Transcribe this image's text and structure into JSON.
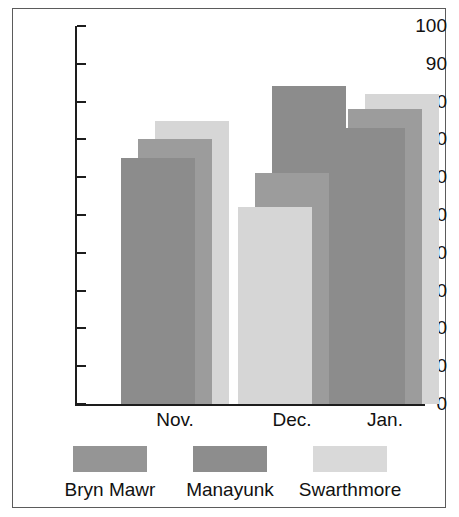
{
  "chart_data": {
    "type": "bar",
    "title": "",
    "subtitle": "",
    "xlabel": "",
    "ylabel": "",
    "categories": [
      "Nov.",
      "Dec.",
      "Jan."
    ],
    "series": [
      {
        "name": "Bryn Mawr",
        "values": [
          65,
          52,
          73
        ],
        "color": "#8f8f8f"
      },
      {
        "name": "Manayunk",
        "values": [
          70,
          61,
          78
        ],
        "color": "#9e9e9e"
      },
      {
        "name": "Swarthmore",
        "values": [
          75,
          84,
          82
        ],
        "color": "#d6d6d6"
      }
    ],
    "ylim": [
      0,
      100
    ],
    "ytick_step": 10,
    "ytick_labels": [
      "100",
      "90",
      "80",
      "70",
      "60",
      "50",
      "40",
      "30",
      "20",
      "10",
      "0"
    ],
    "ytick_values": [
      100,
      90,
      80,
      70,
      60,
      50,
      40,
      30,
      20,
      10,
      0
    ],
    "grid": false,
    "legend_position": "bottom",
    "style": "overlapping-3d-grouped-bars",
    "note_dec_front_bar_is_light": "In the Dec. group the front (Bryn Mawr) bar renders light and the back (Swarthmore) bar renders dark"
  },
  "axis": {
    "y_ticks": [
      {
        "label": "100",
        "value": 100
      },
      {
        "label": "90",
        "value": 90
      },
      {
        "label": "80",
        "value": 80
      },
      {
        "label": "70",
        "value": 70
      },
      {
        "label": "60",
        "value": 60
      },
      {
        "label": "50",
        "value": 50
      },
      {
        "label": "40",
        "value": 40
      },
      {
        "label": "30",
        "value": 30
      },
      {
        "label": "20",
        "value": 20
      },
      {
        "label": "10",
        "value": 10
      },
      {
        "label": "0",
        "value": 0
      }
    ],
    "x_labels": [
      "Nov.",
      "Dec.",
      "Jan."
    ]
  },
  "legend": {
    "items": [
      {
        "label": "Bryn Mawr",
        "swatch_color": "#959595"
      },
      {
        "label": "Manayunk",
        "swatch_color": "#8d8d8d"
      },
      {
        "label": "Swarthmore",
        "swatch_color": "#d9d9d9"
      }
    ]
  },
  "colors": {
    "frame_border": "#5b5b5b",
    "axis": "#1d1d1d",
    "text": "#111111",
    "background": "#ffffff",
    "gray_dark": "#8a8a8a",
    "gray_mid": "#9e9e9e",
    "gray_light": "#d6d6d6"
  }
}
